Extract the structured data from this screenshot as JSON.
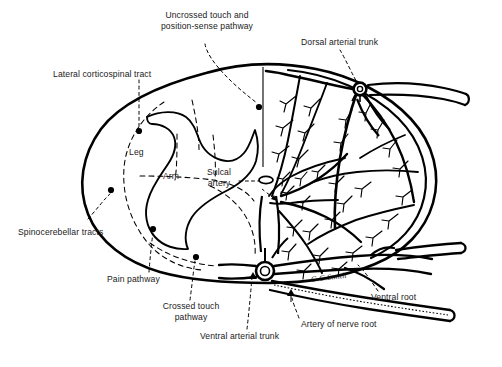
{
  "figure": {
    "signature": "G.G.Smith",
    "ink_color": "#000000",
    "background": "#ffffff"
  },
  "labels": {
    "uncrossed_touch": "Uncrossed touch and\nposition-sense pathway",
    "dorsal_arterial_trunk": "Dorsal arterial trunk",
    "lateral_corticospinal": "Lateral corticospinal tract",
    "leg": "Leg",
    "arm": "Arm",
    "sulcal_artery": "Sulcal\nartery",
    "spinocerebellar": "Spinocerebellar tracts",
    "pain_pathway": "Pain pathway",
    "crossed_touch": "Crossed touch\npathway",
    "ventral_arterial_trunk": "Ventral arterial trunk",
    "artery_of_nerve_root": "Artery of nerve root",
    "ventral_root": "Ventral root"
  },
  "callouts": [
    {
      "name": "uncrossed-touch-and-position-sense-pathway",
      "dot": [
        259,
        107
      ]
    },
    {
      "name": "dorsal-arterial-trunk",
      "dot": [
        360,
        89
      ]
    },
    {
      "name": "lateral-corticospinal-tract",
      "dot": [
        139,
        131
      ]
    },
    {
      "name": "spinocerebellar-tracts",
      "dot": [
        111,
        190
      ]
    },
    {
      "name": "pain-pathway",
      "dot": [
        153,
        229
      ]
    },
    {
      "name": "crossed-touch-pathway",
      "dot": [
        196,
        257
      ]
    },
    {
      "name": "sulcal-artery",
      "dot": [
        268,
        180
      ]
    },
    {
      "name": "ventral-arterial-trunk",
      "dot": [
        253,
        272
      ]
    },
    {
      "name": "artery-of-nerve-root",
      "dot": [
        291,
        289
      ]
    },
    {
      "name": "ventral-root",
      "dot": [
        355,
        262
      ]
    }
  ]
}
